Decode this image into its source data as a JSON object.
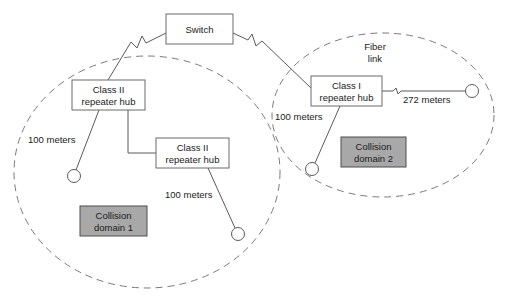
{
  "diagram": {
    "colors": {
      "background": "#ffffff",
      "box_fill": "#ffffff",
      "box_stroke": "#6b6b6b",
      "domain_fill": "#a8a8a8",
      "domain_stroke": "#4d4d4d",
      "line": "#5a5a5a",
      "ellipse": "#7a7a7a",
      "text": "#1a1a1a"
    },
    "nodes": {
      "switch": {
        "label": "Switch"
      },
      "hub_left_top": {
        "label_line1": "Class II",
        "label_line2": "repeater hub"
      },
      "hub_left_lower": {
        "label_line1": "Class II",
        "label_line2": "repeater hub"
      },
      "hub_right": {
        "label_line1": "Class I",
        "label_line2": "repeater hub"
      }
    },
    "domains": {
      "domain1": {
        "label_line1": "Collision",
        "label_line2": "domain 1"
      },
      "domain2": {
        "label_line1": "Collision",
        "label_line2": "domain 2"
      }
    },
    "annotations": {
      "fiber_link_line1": "Fiber",
      "fiber_link_line2": "link",
      "length_left_station": "100 meters",
      "length_left_lower_station": "100 meters",
      "length_right_station": "100 meters",
      "length_fiber": "272 meters"
    },
    "stations": [
      {
        "name": "station-left-upper"
      },
      {
        "name": "station-left-lower"
      },
      {
        "name": "station-right-lower"
      },
      {
        "name": "station-right-fiber"
      }
    ]
  }
}
